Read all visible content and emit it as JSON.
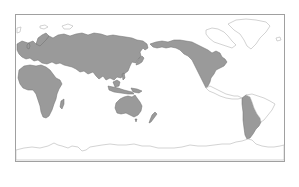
{
  "map": {
    "projection": "equirectangular, Pacific-centered",
    "colors": {
      "background": "#ffffff",
      "filled_region": "#9a9a9a",
      "filled_stroke": "#6f6f6f",
      "outline_region": "#bdbdbd",
      "frame": "#9e9e9e"
    },
    "regions_filled": [
      "Eurasia",
      "Africa",
      "Australia",
      "New Zealand",
      "North America",
      "Western South America",
      "Japan",
      "Southeast Asian islands",
      "Great Britain",
      "Madagascar"
    ],
    "regions_outline": [
      "Greenland",
      "Canadian Arctic islands",
      "Central America",
      "Eastern South America",
      "Antarctica",
      "Svalbard",
      "Novaya Zemlya"
    ]
  }
}
